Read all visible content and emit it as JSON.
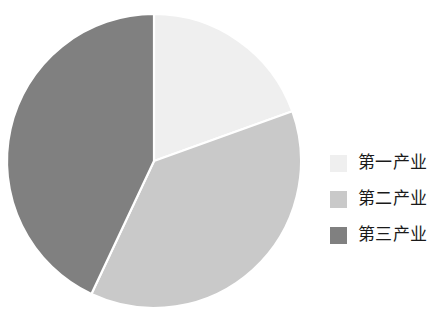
{
  "chart_data": {
    "type": "pie",
    "title": "",
    "subtitle": "",
    "xlabel": "",
    "ylabel": "",
    "legend_position": "right",
    "grid": false,
    "start_angle_deg": 0,
    "direction": "clockwise",
    "categories": [
      "第一产业",
      "第二产业",
      "第三产业"
    ],
    "values": [
      19.5,
      37.5,
      43.0
    ],
    "units": "%",
    "colors": [
      "#efefef",
      "#c9c9c9",
      "#808080"
    ],
    "slices": [
      {
        "label": "第一产业",
        "value": 19.5,
        "color": "#efefef",
        "start_deg": 0,
        "end_deg": 70.2
      },
      {
        "label": "第二产业",
        "value": 37.5,
        "color": "#c9c9c9",
        "start_deg": 70.2,
        "end_deg": 205.2
      },
      {
        "label": "第三产业",
        "value": 43.0,
        "color": "#808080",
        "start_deg": 205.2,
        "end_deg": 360
      }
    ]
  },
  "legend": {
    "items": [
      {
        "label": "第一产业",
        "color": "#efefef"
      },
      {
        "label": "第二产业",
        "color": "#c9c9c9"
      },
      {
        "label": "第三产业",
        "color": "#808080"
      }
    ]
  },
  "geometry": {
    "center_x": 154,
    "center_y": 161,
    "radius": 147,
    "separator_color": "#ffffff",
    "separator_width": 2.2
  }
}
